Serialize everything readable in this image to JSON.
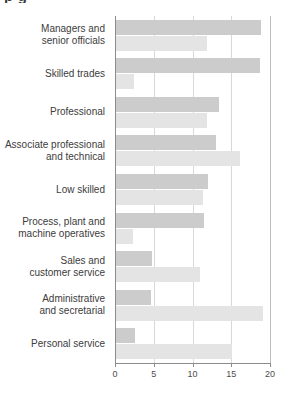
{
  "title_fragment": "p g",
  "chart_data": {
    "type": "bar",
    "orientation": "horizontal",
    "title": "",
    "xlabel": "",
    "ylabel": "",
    "xlim": [
      0,
      20
    ],
    "xticks": [
      0,
      5,
      10,
      15,
      20
    ],
    "xtick_labels": [
      "0",
      "5",
      "10",
      "15",
      "20"
    ],
    "grid": true,
    "grid_axis": "x",
    "legend": "none",
    "categories": [
      "Managers and\nsenior officials",
      "Skilled trades",
      "Professional",
      "Associate professional\nand technical",
      "Low skilled",
      "Process, plant and\nmachine operatives",
      "Sales and\ncustomer service",
      "Administrative\nand secretarial",
      "Personal service"
    ],
    "series": [
      {
        "name": "series-1",
        "color": "#cccccc",
        "values": [
          18.7,
          18.6,
          13.3,
          12.9,
          11.9,
          11.4,
          4.6,
          4.5,
          2.5
        ]
      },
      {
        "name": "series-2",
        "color": "#e4e4e4",
        "values": [
          11.7,
          2.3,
          11.8,
          16.0,
          11.2,
          2.2,
          10.8,
          19.0,
          15.0
        ]
      }
    ]
  }
}
